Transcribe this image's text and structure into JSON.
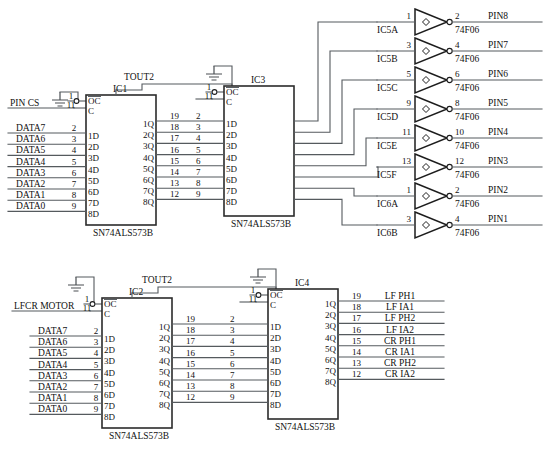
{
  "diagram": {
    "title_caption": "",
    "colors": {
      "wire": "#555a5e",
      "outline": "#2b2b2b",
      "background": "#ffffff"
    }
  },
  "data_bus": {
    "labels": [
      "DATA7",
      "DATA6",
      "DATA5",
      "DATA4",
      "DATA3",
      "DATA2",
      "DATA1",
      "DATA0"
    ],
    "pins": [
      "2",
      "3",
      "4",
      "5",
      "6",
      "7",
      "8",
      "9"
    ]
  },
  "latch_inputs": [
    "1D",
    "2D",
    "3D",
    "4D",
    "5D",
    "6D",
    "7D",
    "8D"
  ],
  "latch_outputs": [
    "1Q",
    "2Q",
    "3Q",
    "4Q",
    "5Q",
    "6Q",
    "7Q",
    "8Q"
  ],
  "latch_output_pins": [
    "19",
    "18",
    "17",
    "16",
    "15",
    "14",
    "13",
    "12"
  ],
  "control_pins": {
    "oc_label": "OC",
    "oc_pin": "1",
    "c_label": "C",
    "c_pin": "11"
  },
  "part_number": "SN74ALS573B",
  "chips": {
    "ic1": {
      "ref": "IC1",
      "part": "SN74ALS573B",
      "enable_net": "PIN CS",
      "clock_net": "TOUT2"
    },
    "ic3": {
      "ref": "IC3",
      "part": "SN74ALS573B",
      "clock_net": "TOUT2"
    },
    "ic2": {
      "ref": "IC2",
      "part": "SN74ALS573B",
      "enable_net": "LFCR MOTOR",
      "clock_net": "TOUT2"
    },
    "ic4": {
      "ref": "IC4",
      "part": "SN74ALS573B",
      "clock_net": "TOUT2"
    }
  },
  "inverters": {
    "part": "74F06",
    "items": [
      {
        "ref": "IC5A",
        "in_pin": "1",
        "out_pin": "2",
        "out_net": "PIN8"
      },
      {
        "ref": "IC5B",
        "in_pin": "3",
        "out_pin": "4",
        "out_net": "PIN7"
      },
      {
        "ref": "IC5C",
        "in_pin": "5",
        "out_pin": "6",
        "out_net": "PIN6"
      },
      {
        "ref": "IC5D",
        "in_pin": "9",
        "out_pin": "8",
        "out_net": "PIN5"
      },
      {
        "ref": "IC5E",
        "in_pin": "11",
        "out_pin": "10",
        "out_net": "PIN4"
      },
      {
        "ref": "IC5F",
        "in_pin": "13",
        "out_pin": "12",
        "out_net": "PIN3"
      },
      {
        "ref": "IC6A",
        "in_pin": "1",
        "out_pin": "2",
        "out_net": "PIN2"
      },
      {
        "ref": "IC6B",
        "in_pin": "3",
        "out_pin": "4",
        "out_net": "PIN1"
      }
    ]
  },
  "ic4_outputs": {
    "pins": [
      "19",
      "18",
      "17",
      "16",
      "15",
      "14",
      "13",
      "12"
    ],
    "nets": [
      "LF PH1",
      "LF IA1",
      "LF PH2",
      "LF IA2",
      "CR PH1",
      "CR IA1",
      "CR PH2",
      "CR IA2"
    ]
  },
  "interconnect_pins": {
    "source_pins": [
      "19",
      "18",
      "17",
      "16",
      "15",
      "14",
      "13",
      "12"
    ],
    "dest_pins": [
      "2",
      "3",
      "4",
      "5",
      "6",
      "7",
      "8",
      "9"
    ]
  }
}
